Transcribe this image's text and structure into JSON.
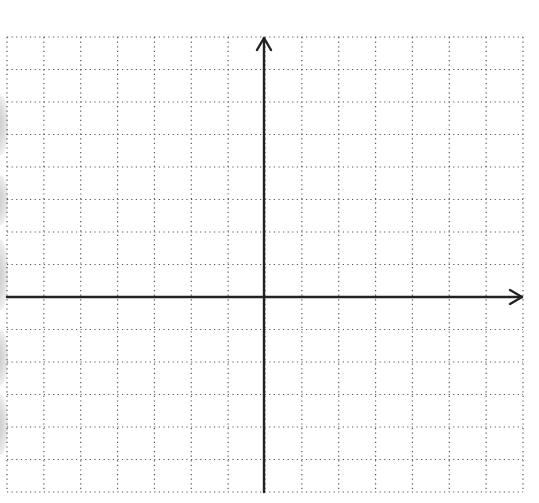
{
  "diagram": {
    "type": "coordinate-plane",
    "grid": {
      "columns": 14,
      "rows": 14,
      "left": 7,
      "right": 523,
      "top": 37,
      "bottom": 492,
      "line_style": "dotted",
      "line_color": "#555555"
    },
    "axes": {
      "origin_px": [
        264,
        297
      ],
      "x_axis": {
        "from": 7,
        "to": 522,
        "arrow": "right"
      },
      "y_axis": {
        "from": 492,
        "to": 38,
        "arrow": "up"
      },
      "color": "#222222"
    },
    "labels": [],
    "scan_artifacts": {
      "left_edge_shadows": [
        {
          "top": 95,
          "height": 60
        },
        {
          "top": 175,
          "height": 50
        },
        {
          "top": 240,
          "height": 70
        },
        {
          "top": 330,
          "height": 55
        },
        {
          "top": 395,
          "height": 60
        }
      ]
    }
  }
}
